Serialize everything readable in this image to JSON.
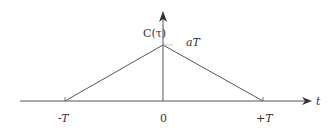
{
  "diagram": {
    "y_label": "C(τ)",
    "x_label": "t",
    "peak_label": "aT",
    "ticks": [
      {
        "label": "-T",
        "x": -1
      },
      {
        "label": "0",
        "x": 0
      },
      {
        "label": "+T",
        "x": 1
      }
    ],
    "shape": "triangle",
    "points": [
      [
        -1,
        0
      ],
      [
        0,
        1
      ],
      [
        1,
        0
      ]
    ],
    "line_color": "#555555"
  }
}
